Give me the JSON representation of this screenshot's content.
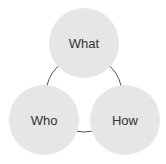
{
  "diagram": {
    "type": "venn-cycle",
    "nodes": [
      {
        "id": "what",
        "label": "What"
      },
      {
        "id": "who",
        "label": "Who"
      },
      {
        "id": "how",
        "label": "How"
      }
    ],
    "colors": {
      "node_fill": "#e6e6e6",
      "connector": "#555555",
      "text": "#333333"
    }
  }
}
